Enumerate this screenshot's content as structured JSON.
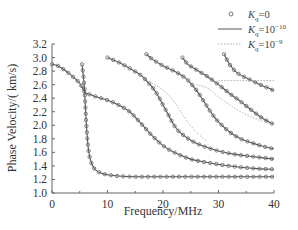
{
  "chart_data": {
    "type": "line",
    "title": "",
    "xlabel": "Frequency/MHz",
    "ylabel": "Phase Velocity/( km/s)",
    "xlim": [
      0,
      40
    ],
    "ylim": [
      1.0,
      3.2
    ],
    "xticks": [
      "0",
      "10",
      "20",
      "30",
      "40"
    ],
    "yticks": [
      "1.0",
      "1.2",
      "1.4",
      "1.6",
      "1.8",
      "2.0",
      "2.2",
      "2.4",
      "2.6",
      "2.8",
      "3.0",
      "3.2"
    ],
    "grid": false,
    "legend_position": "top-right",
    "legend": [
      {
        "label_base": "K",
        "label_sub": "q",
        "label_rest": "=0",
        "style": "circles"
      },
      {
        "label_base": "K",
        "label_sub": "q",
        "label_rest": "=10",
        "label_sup": "−10",
        "style": "solid"
      },
      {
        "label_base": "K",
        "label_sub": "q",
        "label_rest": "=10",
        "label_sup": "−9",
        "style": "dotted"
      }
    ],
    "series": [
      {
        "name": "mode-0",
        "x": [
          5.4,
          5.8,
          6.2,
          6.6,
          7.2,
          8,
          9,
          10,
          12,
          15,
          20,
          25,
          30,
          35,
          40
        ],
        "y": [
          2.9,
          2.6,
          2.0,
          1.62,
          1.42,
          1.33,
          1.29,
          1.27,
          1.25,
          1.24,
          1.24,
          1.24,
          1.24,
          1.24,
          1.24
        ]
      },
      {
        "name": "mode-1",
        "x": [
          0,
          1,
          2,
          3,
          4,
          5,
          5.5,
          6,
          7,
          8,
          10,
          12,
          14,
          16,
          18,
          20,
          22,
          25,
          28,
          31,
          34,
          37,
          40
        ],
        "y": [
          2.9,
          2.88,
          2.83,
          2.77,
          2.7,
          2.62,
          2.55,
          2.48,
          2.45,
          2.42,
          2.37,
          2.3,
          2.2,
          2.03,
          1.85,
          1.7,
          1.6,
          1.5,
          1.45,
          1.41,
          1.38,
          1.36,
          1.35
        ]
      },
      {
        "name": "mode-2",
        "x": [
          10,
          12,
          14,
          16,
          17,
          18,
          19,
          20,
          21,
          22,
          23,
          25,
          27,
          30,
          33,
          36,
          40
        ],
        "y": [
          3.0,
          2.93,
          2.84,
          2.74,
          2.66,
          2.57,
          2.45,
          2.3,
          2.15,
          2.0,
          1.9,
          1.78,
          1.7,
          1.62,
          1.57,
          1.54,
          1.5
        ]
      },
      {
        "name": "mode-3",
        "x": [
          17,
          18,
          20,
          22,
          24,
          25,
          26,
          27,
          28,
          29,
          30,
          32,
          34,
          36,
          38,
          40
        ],
        "y": [
          3.05,
          2.98,
          2.88,
          2.8,
          2.7,
          2.62,
          2.52,
          2.4,
          2.27,
          2.15,
          2.05,
          1.9,
          1.8,
          1.74,
          1.69,
          1.65
        ]
      },
      {
        "name": "mode-4",
        "x": [
          23.5,
          24.5,
          26,
          28,
          30,
          32,
          34,
          36,
          38,
          40
        ],
        "y": [
          3.0,
          2.9,
          2.82,
          2.72,
          2.6,
          2.47,
          2.35,
          2.22,
          2.1,
          2.01
        ]
      },
      {
        "name": "mode-5",
        "x": [
          31,
          32,
          33,
          34,
          35,
          36,
          37,
          38,
          39,
          40
        ],
        "y": [
          3.05,
          2.9,
          2.8,
          2.74,
          2.7,
          2.66,
          2.62,
          2.58,
          2.55,
          2.51
        ]
      },
      {
        "name": "dotted-deviation-1",
        "x": [
          18,
          20,
          22,
          24,
          26,
          28
        ],
        "y": [
          2.62,
          2.52,
          2.35,
          2.1,
          1.9,
          1.76
        ]
      },
      {
        "name": "dotted-deviation-2",
        "x": [
          26,
          28,
          30,
          32,
          34,
          36,
          38,
          40
        ],
        "y": [
          2.6,
          2.55,
          2.42,
          2.3,
          2.2,
          2.12,
          2.06,
          2.01
        ]
      },
      {
        "name": "dotted-deviation-3",
        "x": [
          30,
          32,
          34,
          36,
          38,
          40
        ],
        "y": [
          2.66,
          2.66,
          2.66,
          2.66,
          2.66,
          2.66
        ]
      }
    ]
  }
}
